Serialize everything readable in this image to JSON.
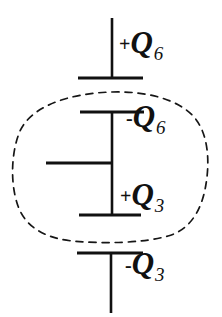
{
  "figure": {
    "background_color": "#ffffff",
    "stroke_color": "#111111",
    "width": 222,
    "height": 317
  },
  "labels": {
    "top_plate": {
      "sign": "+",
      "symbol": "Q",
      "subscript": "6",
      "full": "+Q6"
    },
    "second_plate": {
      "sign": "-",
      "symbol": "Q",
      "subscript": "6",
      "full": "-Q6"
    },
    "third_plate": {
      "sign": "+",
      "symbol": "Q",
      "subscript": "3",
      "full": "+Q3"
    },
    "bottom_plate": {
      "sign": "-",
      "symbol": "Q",
      "subscript": "3",
      "full": "-Q3"
    }
  },
  "elements": {
    "gaussian_surface": "dashed-closed-curve",
    "top_lead": "vertical-wire-top",
    "bottom_lead": "vertical-wire-bottom",
    "middle_branch": "horizontal-wire-left"
  }
}
